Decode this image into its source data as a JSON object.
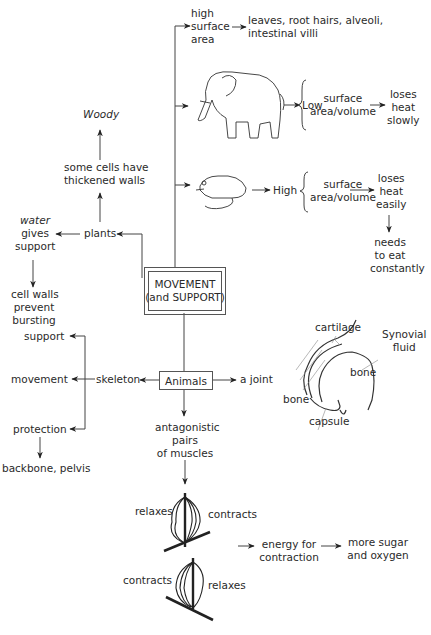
{
  "center": {
    "line1": "MOVEMENT",
    "line2": "(and SUPPORT)"
  },
  "surface_area": {
    "high_sa": [
      "high",
      "surface",
      "area"
    ],
    "examples": [
      "leaves, root hairs, alveoli,",
      "intestinal villi"
    ],
    "elephant": {
      "level": "Low",
      "ratio": [
        "surface",
        "area/volume"
      ],
      "result": [
        "loses",
        "heat",
        "slowly"
      ]
    },
    "mouse": {
      "level": "High",
      "ratio": [
        "surface",
        "area/volume"
      ],
      "result": [
        "loses",
        "heat",
        "easily"
      ],
      "consequence": [
        "needs",
        "to eat",
        "constantly"
      ]
    }
  },
  "plants": {
    "label": "plants",
    "thick_walls": [
      "some cells have",
      "thickened walls"
    ],
    "woody": "Woody",
    "water": [
      "water",
      "gives",
      "support"
    ],
    "cell_walls": [
      "cell walls",
      "prevent",
      "bursting"
    ]
  },
  "animals": {
    "label": "Animals",
    "skeleton": "skeleton",
    "skeleton_roles": [
      "support",
      "movement",
      "protection"
    ],
    "protection_examples": "backbone, pelvis",
    "joint": "a joint",
    "joint_parts": {
      "cartilage": "cartilage",
      "synovial": [
        "Synovial",
        "fluid"
      ],
      "bone_upper": "bone",
      "bone_lower": "bone",
      "capsule": "capsule"
    },
    "muscles": [
      "antagonistic",
      "pairs",
      "of muscles"
    ],
    "muscle_top": {
      "left": "relaxes",
      "right": "contracts"
    },
    "muscle_bottom": {
      "left": "contracts",
      "right": "relaxes"
    },
    "energy": [
      "energy for",
      "contraction"
    ],
    "sugar": [
      "more sugar",
      "and oxygen"
    ]
  }
}
